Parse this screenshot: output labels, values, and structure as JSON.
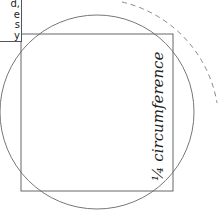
{
  "caption_box": {
    "lines": [
      "d,",
      "e",
      "s",
      "y"
    ]
  },
  "diagram": {
    "label": "¼ circumference",
    "square": {
      "x": 21,
      "y": 34,
      "width": 152,
      "height": 157,
      "stroke": "#666666"
    },
    "circle": {
      "cx": 97,
      "cy": 112,
      "r": 97,
      "stroke": "#777777"
    },
    "dashed_arc": {
      "stroke": "#888888",
      "dash": "5 4"
    }
  }
}
